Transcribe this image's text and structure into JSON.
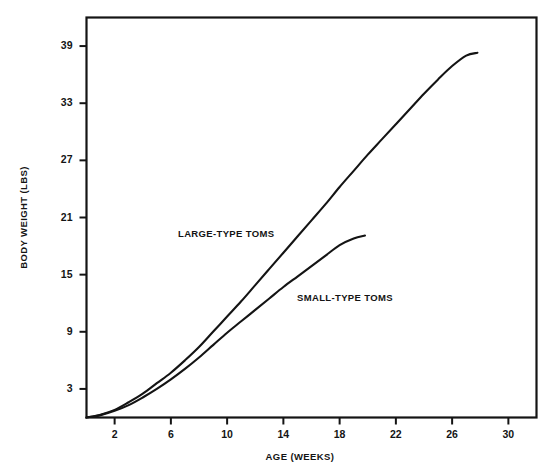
{
  "chart_data": {
    "type": "line",
    "title": "",
    "xlabel": "AGE (WEEKS)",
    "ylabel": "BODY WEIGHT (LBS)",
    "xlim": [
      0,
      32
    ],
    "ylim": [
      0,
      42
    ],
    "xticks": [
      2,
      6,
      10,
      14,
      18,
      22,
      26,
      30
    ],
    "yticks": [
      3,
      9,
      15,
      21,
      27,
      33,
      39
    ],
    "grid": false,
    "legend_position": "inline-annotations",
    "series": [
      {
        "name": "LARGE-TYPE TOMS",
        "x": [
          0,
          1,
          2,
          3,
          4,
          5,
          6,
          7,
          8,
          9,
          10,
          11,
          12,
          13,
          14,
          15,
          16,
          17,
          18,
          19,
          20,
          21,
          22,
          23,
          24,
          25,
          26,
          27,
          27.8
        ],
        "values": [
          0.0,
          0.3,
          0.8,
          1.6,
          2.5,
          3.6,
          4.7,
          6.0,
          7.4,
          9.0,
          10.6,
          12.2,
          13.9,
          15.6,
          17.3,
          19.0,
          20.7,
          22.4,
          24.2,
          25.9,
          27.6,
          29.2,
          30.8,
          32.4,
          34.0,
          35.5,
          36.9,
          38.0,
          38.3
        ]
      },
      {
        "name": "SMALL-TYPE TOMS",
        "x": [
          0,
          1,
          2,
          3,
          4,
          5,
          6,
          7,
          8,
          9,
          10,
          11,
          12,
          13,
          14,
          15,
          16,
          17,
          18,
          19,
          19.8
        ],
        "values": [
          0.0,
          0.25,
          0.7,
          1.3,
          2.1,
          3.0,
          4.0,
          5.1,
          6.3,
          7.6,
          8.9,
          10.1,
          11.3,
          12.5,
          13.7,
          14.8,
          15.9,
          17.0,
          18.1,
          18.8,
          19.1
        ]
      }
    ],
    "annotations": [
      {
        "text": "LARGE-TYPE TOMS",
        "x_px": 178,
        "y_px": 228
      },
      {
        "text": "SMALL-TYPE TOMS",
        "x_px": 297,
        "y_px": 292
      }
    ],
    "colors": {
      "line": "#141414",
      "frame": "#141414",
      "background": "#ffffff",
      "text": "#141414"
    }
  },
  "axes": {
    "y_title": "BODY WEIGHT (LBS)",
    "x_title": "AGE (WEEKS)",
    "y_tick_labels": [
      "39",
      "33",
      "27",
      "21",
      "15",
      "9",
      "3"
    ],
    "x_tick_labels": [
      "2",
      "6",
      "10",
      "14",
      "18",
      "22",
      "26",
      "30"
    ]
  }
}
